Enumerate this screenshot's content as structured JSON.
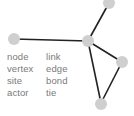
{
  "diagram": {
    "colors": {
      "node": "#cfcfcf",
      "edge": "#222222",
      "text": "#7a7a7a"
    },
    "nodes": [
      {
        "id": "left",
        "x": 14,
        "y": 39
      },
      {
        "id": "hub",
        "x": 88,
        "y": 41
      },
      {
        "id": "top",
        "x": 109,
        "y": 3
      },
      {
        "id": "right",
        "x": 122,
        "y": 62
      },
      {
        "id": "bottom",
        "x": 101,
        "y": 103
      }
    ],
    "edges": [
      [
        "left",
        "hub"
      ],
      [
        "hub",
        "top"
      ],
      [
        "hub",
        "right"
      ],
      [
        "hub",
        "bottom"
      ],
      [
        "right",
        "bottom"
      ]
    ],
    "labels": {
      "col1": [
        "node",
        "vertex",
        "site",
        "actor"
      ],
      "col2": [
        "link",
        "edge",
        "bond",
        "tie"
      ]
    }
  }
}
